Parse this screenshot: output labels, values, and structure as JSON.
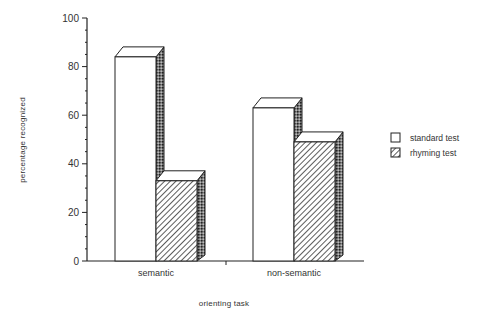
{
  "chart_data": {
    "type": "bar",
    "style": "3d-grouped",
    "title": "",
    "xlabel": "orienting task",
    "ylabel": "percentage recognized",
    "ylim": [
      0,
      100
    ],
    "yticks": [
      0,
      20,
      40,
      60,
      80,
      100
    ],
    "grid": false,
    "legend_position": "right",
    "categories": [
      "semantic",
      "non-semantic"
    ],
    "series": [
      {
        "name": "standard test",
        "pattern": "white",
        "values": [
          84,
          63
        ]
      },
      {
        "name": "rhyming test",
        "pattern": "diagonal-hatch",
        "values": [
          33,
          49
        ]
      }
    ]
  },
  "labels": {
    "yticks": [
      "0",
      "20",
      "40",
      "60",
      "80",
      "100"
    ],
    "categories": [
      "semantic",
      "non-semantic"
    ],
    "xlabel": "orienting  task",
    "ylabel": "percentage recognized",
    "legend": [
      "standard test",
      "rhyming test"
    ]
  }
}
